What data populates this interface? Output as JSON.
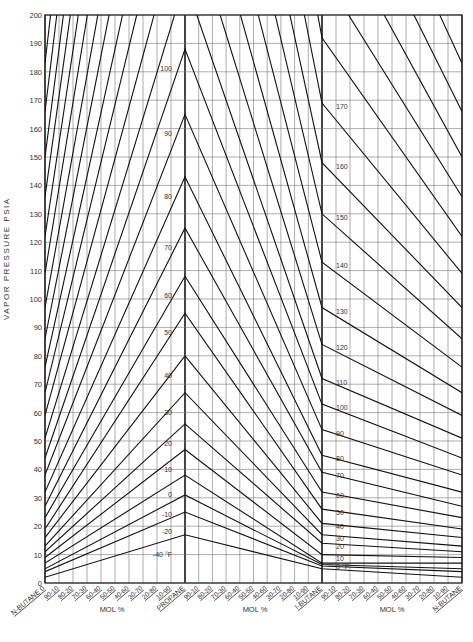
{
  "chart_data": {
    "type": "line",
    "ylabel": "VAPOR PRESSURE PSIA",
    "xlabel": "MOL %",
    "ylim": [
      0,
      200
    ],
    "yticks": [
      0,
      10,
      20,
      30,
      40,
      50,
      60,
      70,
      80,
      90,
      100,
      110,
      120,
      130,
      140,
      150,
      160,
      170,
      180,
      190,
      200
    ],
    "x_sections": [
      {
        "from": "N-BUTANE",
        "to": "PROPANE",
        "ticks": [
          "N-BUTANE 0",
          "90-10",
          "80-20",
          "70-30",
          "60-40",
          "50-50",
          "40-60",
          "30-70",
          "20-80",
          "10-90",
          "PROPANE"
        ]
      },
      {
        "from": "PROPANE",
        "to": "I-BUTANE",
        "ticks": [
          "PROPANE",
          "90-10",
          "80-20",
          "70-30",
          "60-40",
          "50-50",
          "40-60",
          "30-70",
          "20-80",
          "10-90",
          "I-BUTANE"
        ]
      },
      {
        "from": "I-BUTANE",
        "to": "N-BUTANE",
        "ticks": [
          "I-BUTANE",
          "90-10",
          "80-20",
          "70-30",
          "60-40",
          "50-50",
          "40-60",
          "30-70",
          "20-80",
          "10-90",
          "N-BUTANE"
        ]
      }
    ],
    "x_axis_labels": [
      "N-BUTANE",
      "PROPANE",
      "I-BUTANE",
      "N-BUTANE"
    ],
    "mol_labels": [
      "MOL %",
      "MOL %",
      "MOL %"
    ],
    "series_note": "Isotherms (°F); values are psia at N-butane, Propane, I-butane, N-butane",
    "series": [
      {
        "name": "-40 °F",
        "label": "-40 °F",
        "values": [
          2,
          17,
          5,
          2
        ]
      },
      {
        "name": "-20",
        "label": "-20",
        "values": [
          4,
          25,
          6,
          4
        ]
      },
      {
        "name": "-10",
        "label": "-10",
        "values": [
          5,
          31,
          6.5,
          5
        ]
      },
      {
        "name": "0",
        "label": "0",
        "values": [
          7,
          38,
          7,
          7
        ]
      },
      {
        "name": "10",
        "label": "10",
        "values": [
          9,
          47,
          10,
          9
        ]
      },
      {
        "name": "20",
        "label": "20",
        "values": [
          11,
          56,
          14,
          11
        ]
      },
      {
        "name": "30",
        "label": "30",
        "values": [
          13,
          67,
          17,
          13
        ]
      },
      {
        "name": "40",
        "label": "40",
        "values": [
          16,
          80,
          21,
          16
        ]
      },
      {
        "name": "50",
        "label": "50",
        "values": [
          19,
          95,
          26,
          19
        ]
      },
      {
        "name": "60",
        "label": "60",
        "values": [
          23,
          108,
          32,
          23
        ]
      },
      {
        "name": "70",
        "label": "70",
        "values": [
          27,
          125,
          39,
          27
        ]
      },
      {
        "name": "80",
        "label": "80",
        "values": [
          32,
          143,
          45,
          32
        ]
      },
      {
        "name": "90",
        "label": "90",
        "values": [
          38,
          165,
          54,
          38
        ]
      },
      {
        "name": "100",
        "label": "100",
        "values": [
          44,
          188,
          63,
          44
        ]
      },
      {
        "name": "110",
        "label": "110",
        "values": [
          51,
          212,
          72,
          51
        ]
      },
      {
        "name": "120",
        "label": "120",
        "values": [
          59,
          240,
          84,
          59
        ]
      },
      {
        "name": "130",
        "label": "130",
        "values": [
          67,
          270,
          97,
          67
        ]
      },
      {
        "name": "140",
        "label": "140",
        "values": [
          76,
          300,
          113,
          76
        ]
      },
      {
        "name": "150",
        "label": "150",
        "values": [
          86,
          335,
          130,
          86
        ]
      },
      {
        "name": "160",
        "label": "160",
        "values": [
          97,
          370,
          148,
          97
        ]
      },
      {
        "name": "170",
        "label": "170",
        "values": [
          109,
          410,
          169,
          109
        ]
      },
      {
        "name": "180",
        "label": "180",
        "values": [
          122,
          450,
          192,
          122
        ]
      },
      {
        "name": "190",
        "label": "190",
        "values": [
          136,
          490,
          215,
          136
        ]
      },
      {
        "name": "200",
        "label": "200",
        "values": [
          150,
          530,
          240,
          150
        ]
      },
      {
        "name": "210",
        "label": "210",
        "values": [
          166,
          570,
          265,
          166
        ]
      },
      {
        "name": "220",
        "label": "220",
        "values": [
          183,
          610,
          290,
          183
        ]
      },
      {
        "name": "230",
        "label": "230",
        "values": [
          200,
          650,
          320,
          200
        ]
      }
    ],
    "peak_labels_propane": [
      "100",
      "90",
      "80",
      "70",
      "60",
      "50",
      "40",
      "30",
      "20",
      "10",
      "0",
      "-10",
      "-20",
      "-40 °F"
    ],
    "right_labels_ibutane": [
      "170",
      "160",
      "150",
      "140",
      "130",
      "120",
      "110",
      "100",
      "90",
      "80",
      "70",
      "60",
      "50",
      "40",
      "30",
      "20",
      "10",
      "0 °F"
    ],
    "grid": true
  }
}
